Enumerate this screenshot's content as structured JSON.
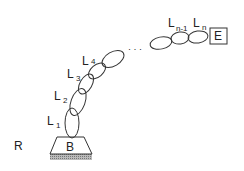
{
  "diagram": {
    "reference_frame_label": "R",
    "base_label": "B",
    "end_effector_label": "E",
    "ellipsis": "· · ·",
    "links": [
      {
        "name": "L",
        "sub": "1"
      },
      {
        "name": "L",
        "sub": "2"
      },
      {
        "name": "L",
        "sub": "3"
      },
      {
        "name": "L",
        "sub": "4"
      },
      {
        "name": "L",
        "sub": "n-1"
      },
      {
        "name": "L",
        "sub": "n"
      }
    ],
    "colors": {
      "stroke": "#333333",
      "hatch": "#999999",
      "background": "#ffffff"
    }
  }
}
